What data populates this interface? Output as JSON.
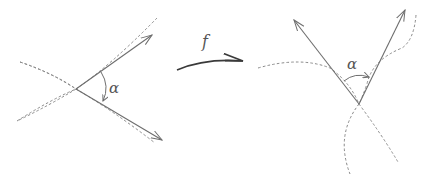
{
  "diagram": {
    "left_figure": {
      "angle_label": "α",
      "vertex": [
        76,
        89
      ],
      "vectors": [
        {
          "from": [
            76,
            89
          ],
          "to": [
            152,
            35
          ]
        },
        {
          "from": [
            76,
            89
          ],
          "to": [
            162,
            140
          ]
        }
      ],
      "curves": 2
    },
    "mapping": {
      "label": "f"
    },
    "right_figure": {
      "angle_label": "α",
      "vertex": [
        359,
        104
      ],
      "vectors": [
        {
          "from": [
            359,
            104
          ],
          "to": [
            294,
            20
          ]
        },
        {
          "from": [
            359,
            104
          ],
          "to": [
            405,
            10
          ]
        }
      ],
      "curves": 2
    },
    "colors": {
      "line": "#6e6e6e",
      "dashed": "#8a8a8a",
      "map_arrow": "#3a3a3a",
      "background": "#ffffff"
    }
  }
}
